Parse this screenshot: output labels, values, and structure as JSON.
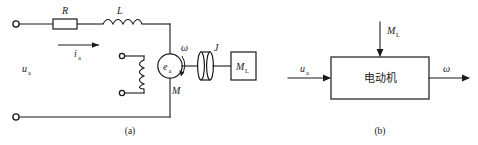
{
  "figure": {
    "panels": [
      {
        "id": "a",
        "caption": "(a)",
        "title_role": "dc-motor-armature-circuit-schematic",
        "labels": {
          "source_voltage": "u",
          "source_voltage_sub": "a",
          "resistor": "R",
          "inductor": "L",
          "current": "i",
          "current_sub": "a",
          "back_emf": "e",
          "back_emf_sub": "a",
          "motor_mark": "M",
          "angular_velocity": "ω",
          "inertia": "J",
          "load_torque": "M",
          "load_torque_sub": "L"
        }
      },
      {
        "id": "b",
        "caption": "(b)",
        "title_role": "motor-block-diagram",
        "labels": {
          "block_name": "电动机",
          "input_voltage": "u",
          "input_voltage_sub": "a",
          "disturbance_torque": "M",
          "disturbance_torque_sub": "L",
          "output_speed": "ω"
        }
      }
    ],
    "colors": {
      "line": "#1a1a1a",
      "background": "#ffffff",
      "fill": "#ffffff"
    }
  }
}
